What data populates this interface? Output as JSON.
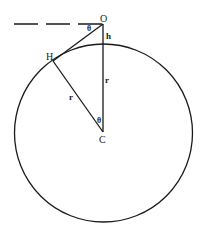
{
  "diagram": {
    "type": "geometry",
    "points": {
      "O": {
        "label": "O",
        "x": 103,
        "y": 24
      },
      "H": {
        "label": "H",
        "x": 53,
        "y": 61
      },
      "C": {
        "label": "C",
        "x": 103,
        "y": 132
      }
    },
    "circle": {
      "cx": 103.5,
      "cy": 133,
      "r": 89
    },
    "dashed_line": {
      "x1": 14,
      "x2": 103,
      "y": 24
    },
    "labels": {
      "O": "O",
      "H": "H",
      "C": "C",
      "h": "h",
      "r_vertical": "r",
      "r_slant": "r",
      "theta_top": "θ",
      "theta_center": "θ"
    },
    "colors": {
      "stroke": "#1a1a1a",
      "background": "#ffffff"
    }
  }
}
